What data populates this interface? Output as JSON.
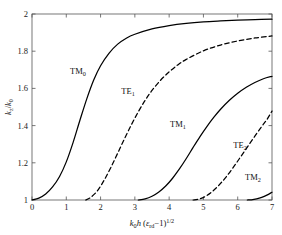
{
  "figure": {
    "background_color": "#ffffff",
    "line_color": "#000000",
    "axis_color": "#4d4d4d"
  },
  "axes": {
    "x_tick_labels": [
      "0",
      "1",
      "2",
      "3",
      "4",
      "5",
      "6",
      "7"
    ],
    "y_tick_labels": [
      "1",
      "1.2",
      "1.4",
      "1.6",
      "1.8",
      "2"
    ],
    "x_label_parts": {
      "k": "k",
      "k_sub": "0",
      "h": "h",
      "open": " (",
      "eps": "ε",
      "eps_sub": "rd",
      "minus_one": "−1)",
      "exp": "1/2"
    },
    "y_label_parts": {
      "kz": "k",
      "kz_sub": "z",
      "slash": "/",
      "k0": "k",
      "k0_sub": "0"
    }
  },
  "curve_labels": [
    {
      "name": "TM0",
      "base": "TM",
      "sub": "0",
      "x": 78,
      "y": 74
    },
    {
      "name": "TE1",
      "base": "TE",
      "sub": "1",
      "x": 128,
      "y": 94
    },
    {
      "name": "TM1",
      "base": "TM",
      "sub": "1",
      "x": 178,
      "y": 127
    },
    {
      "name": "TE2",
      "base": "TE",
      "sub": "2",
      "x": 240,
      "y": 148
    },
    {
      "name": "TM2",
      "base": "TM",
      "sub": "2",
      "x": 253,
      "y": 180
    }
  ],
  "chart_data": {
    "type": "line",
    "title": "",
    "xlabel": "k0h (epsilon_rd - 1)^(1/2)",
    "ylabel": "kz/k0",
    "xlim": [
      0,
      7
    ],
    "ylim": [
      1,
      2
    ],
    "xticks": [
      0,
      1,
      2,
      3,
      4,
      5,
      6,
      7
    ],
    "yticks": [
      1,
      1.2,
      1.4,
      1.6,
      1.8,
      2
    ],
    "grid": false,
    "legend": "inline-annotations",
    "series": [
      {
        "name": "TM0",
        "style": "solid",
        "cutoff": 0.0,
        "x": [
          0.0,
          0.2,
          0.4,
          0.6,
          0.8,
          1.0,
          1.2,
          1.4,
          1.6,
          1.8,
          2.0,
          2.25,
          2.5,
          2.75,
          3.0,
          3.5,
          4.0,
          4.5,
          5.0,
          5.5,
          6.0,
          6.5,
          7.0
        ],
        "y": [
          1.0,
          1.01,
          1.032,
          1.07,
          1.125,
          1.205,
          1.31,
          1.43,
          1.545,
          1.645,
          1.722,
          1.79,
          1.838,
          1.87,
          1.891,
          1.92,
          1.938,
          1.95,
          1.958,
          1.963,
          1.967,
          1.97,
          1.972
        ]
      },
      {
        "name": "TE1",
        "style": "dashed",
        "cutoff": 1.57,
        "x": [
          1.57,
          1.7,
          1.9,
          2.1,
          2.3,
          2.5,
          2.7,
          2.9,
          3.1,
          3.3,
          3.5,
          3.75,
          4.0,
          4.25,
          4.5,
          5.0,
          5.5,
          6.0,
          6.5,
          7.0
        ],
        "y": [
          1.0,
          1.012,
          1.048,
          1.105,
          1.175,
          1.252,
          1.33,
          1.405,
          1.474,
          1.536,
          1.589,
          1.644,
          1.689,
          1.726,
          1.756,
          1.802,
          1.833,
          1.855,
          1.871,
          1.882
        ]
      },
      {
        "name": "TM1",
        "style": "solid",
        "cutoff": 3.1,
        "x": [
          3.1,
          3.3,
          3.5,
          3.7,
          3.9,
          4.1,
          4.3,
          4.5,
          4.7,
          4.9,
          5.1,
          5.3,
          5.5,
          5.75,
          6.0,
          6.25,
          6.5,
          6.75,
          7.0
        ],
        "y": [
          1.0,
          1.006,
          1.02,
          1.043,
          1.075,
          1.117,
          1.167,
          1.223,
          1.283,
          1.341,
          1.395,
          1.444,
          1.488,
          1.535,
          1.574,
          1.606,
          1.632,
          1.652,
          1.665
        ]
      },
      {
        "name": "TE2",
        "style": "dashed",
        "cutoff": 4.7,
        "x": [
          4.7,
          4.9,
          5.1,
          5.3,
          5.5,
          5.7,
          5.9,
          6.1,
          6.3,
          6.5,
          6.7,
          6.85,
          7.0
        ],
        "y": [
          1.0,
          1.007,
          1.024,
          1.052,
          1.089,
          1.133,
          1.183,
          1.236,
          1.29,
          1.343,
          1.395,
          1.432,
          1.478
        ]
      },
      {
        "name": "TM2",
        "style": "solid",
        "cutoff": 6.28,
        "x": [
          6.28,
          6.4,
          6.55,
          6.7,
          6.85,
          7.0
        ],
        "y": [
          1.0,
          1.001,
          1.006,
          1.014,
          1.026,
          1.042
        ]
      }
    ]
  }
}
